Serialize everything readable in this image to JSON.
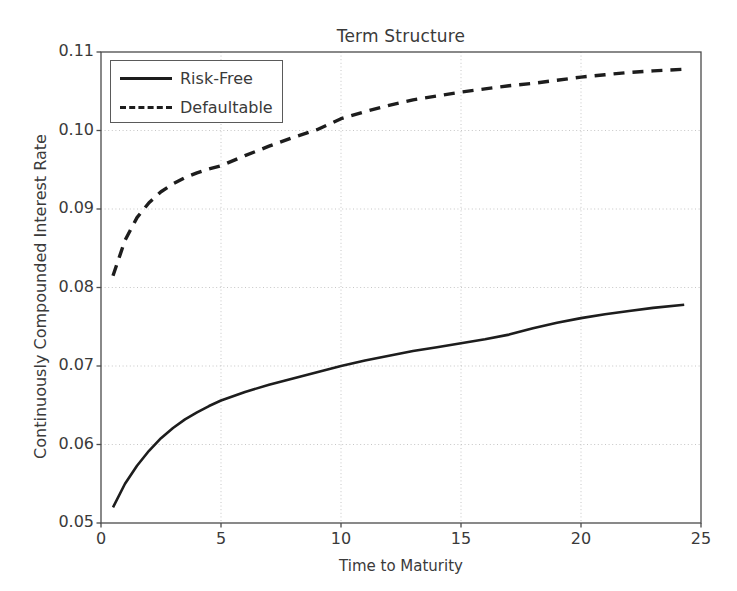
{
  "chart_data": {
    "type": "line",
    "title": "Term Structure",
    "xlabel": "Time to Maturity",
    "ylabel": "Continuously Compounded Interest Rate",
    "xlim": [
      0,
      25
    ],
    "ylim": [
      0.05,
      0.11
    ],
    "xticks": [
      "0",
      "5",
      "10",
      "15",
      "20",
      "25"
    ],
    "xtick_values": [
      0,
      5,
      10,
      15,
      20,
      25
    ],
    "yticks": [
      "0.05",
      "0.06",
      "0.07",
      "0.08",
      "0.09",
      "0.10",
      "0.11"
    ],
    "ytick_values": [
      0.05,
      0.06,
      0.07,
      0.08,
      0.09,
      0.1,
      0.11
    ],
    "grid": true,
    "legend_position": "upper left",
    "line_color": "#1d1d1d",
    "grid_color": "#bfbfbf",
    "axes_color": "#4a4a4a",
    "background": "#ffffff",
    "series": [
      {
        "name": "Risk-Free",
        "style": "solid",
        "x": [
          0.5,
          1.0,
          1.5,
          2.0,
          2.5,
          3.0,
          3.5,
          4.0,
          4.5,
          5.0,
          6.0,
          7.0,
          8.0,
          9.0,
          10.0,
          11.0,
          12.0,
          13.0,
          14.0,
          15.0,
          16.0,
          17.0,
          18.0,
          19.0,
          20.0,
          21.0,
          22.0,
          23.0,
          24.3
        ],
        "values": [
          0.052,
          0.055,
          0.0573,
          0.0592,
          0.0608,
          0.0621,
          0.0632,
          0.0641,
          0.0649,
          0.0656,
          0.0667,
          0.0676,
          0.0684,
          0.0692,
          0.07,
          0.0707,
          0.0713,
          0.0719,
          0.0724,
          0.0729,
          0.0734,
          0.074,
          0.0748,
          0.0755,
          0.0761,
          0.0766,
          0.077,
          0.0774,
          0.0778
        ]
      },
      {
        "name": "Defaultable",
        "style": "dashed",
        "x": [
          0.5,
          1.0,
          1.5,
          2.0,
          2.5,
          3.0,
          3.5,
          4.0,
          4.5,
          5.0,
          6.0,
          7.0,
          8.0,
          9.0,
          10.0,
          11.0,
          12.0,
          13.0,
          14.0,
          15.0,
          16.0,
          17.0,
          18.0,
          19.0,
          20.0,
          21.0,
          22.0,
          23.0,
          24.3
        ],
        "values": [
          0.0815,
          0.086,
          0.0889,
          0.0908,
          0.0922,
          0.0932,
          0.094,
          0.0946,
          0.0951,
          0.0955,
          0.0968,
          0.098,
          0.0991,
          0.1001,
          0.1015,
          0.1024,
          0.1032,
          0.1039,
          0.1044,
          0.1049,
          0.1053,
          0.1057,
          0.106,
          0.1064,
          0.1068,
          0.1071,
          0.1074,
          0.1076,
          0.1078
        ]
      }
    ]
  }
}
